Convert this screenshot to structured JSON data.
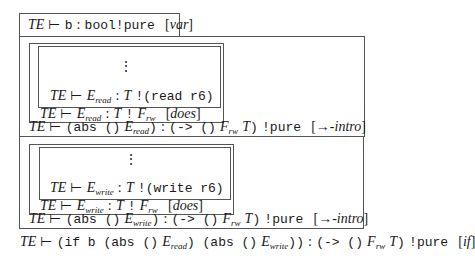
{
  "judgments": {
    "var_rule": {
      "env": "TE",
      "turnstile": "⊢",
      "expr": "b",
      "type": "bool",
      "effect": "pure",
      "rule": "var"
    },
    "read_branch": {
      "premise": {
        "env": "TE",
        "turnstile": "⊢",
        "expr_base": "E",
        "expr_sub": "read",
        "type": "T",
        "effect": "(read r6)"
      },
      "does": {
        "env": "TE",
        "turnstile": "⊢",
        "expr_base": "E",
        "expr_sub": "read",
        "type": "T",
        "effect_base": "F",
        "effect_sub": "rw",
        "rule": "does"
      },
      "intro": {
        "env": "TE",
        "turnstile": "⊢",
        "expr_pre": "(abs ()",
        "expr_base": "E",
        "expr_sub": "read",
        "expr_post": ")",
        "type_pre": "(-> ()",
        "type_f": "F",
        "type_f_sub": "rw",
        "type_t": "T",
        "type_post": ")",
        "effect": "pure",
        "rule": "→-intro"
      }
    },
    "write_branch": {
      "premise": {
        "env": "TE",
        "turnstile": "⊢",
        "expr_base": "E",
        "expr_sub": "write",
        "type": "T",
        "effect": "(write r6)"
      },
      "does": {
        "env": "TE",
        "turnstile": "⊢",
        "expr_base": "E",
        "expr_sub": "write",
        "type": "T",
        "effect_base": "F",
        "effect_sub": "rw",
        "rule": "does"
      },
      "intro": {
        "env": "TE",
        "turnstile": "⊢",
        "expr_pre": "(abs ()",
        "expr_base": "E",
        "expr_sub": "write",
        "expr_post": ")",
        "type_pre": "(-> ()",
        "type_f": "F",
        "type_f_sub": "rw",
        "type_t": "T",
        "type_post": ")",
        "effect": "pure",
        "rule": "→-intro"
      }
    },
    "conclusion": {
      "env": "TE",
      "turnstile": "⊢",
      "expr_a": "(if b (abs ()",
      "e1": "E",
      "e1_sub": "read",
      "expr_b": ") (abs ()",
      "e2": "E",
      "e2_sub": "write",
      "expr_c": "))",
      "type_pre": "(-> ()",
      "type_f": "F",
      "type_f_sub": "rw",
      "type_t": "T",
      "type_post": ")",
      "effect": "pure",
      "rule": "if"
    }
  },
  "symbols": {
    "colon": ":",
    "bang": "!",
    "vdots": "⋮"
  }
}
